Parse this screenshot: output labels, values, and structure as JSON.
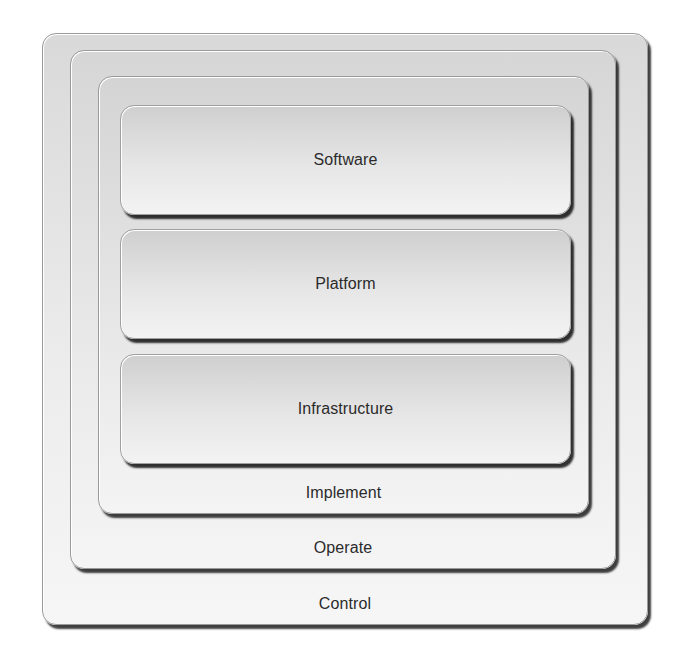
{
  "diagram": {
    "type": "nested-layers",
    "rings": [
      {
        "id": "control",
        "label": "Control"
      },
      {
        "id": "operate",
        "label": "Operate"
      },
      {
        "id": "implement",
        "label": "Implement"
      }
    ],
    "layers": [
      {
        "id": "software",
        "label": "Software"
      },
      {
        "id": "platform",
        "label": "Platform"
      },
      {
        "id": "infrastructure",
        "label": "Infrastructure"
      }
    ],
    "colors": {
      "text": "#2b2b2b",
      "box_fill_top": "#d2d2d2",
      "box_fill_bottom": "#f4f4f4",
      "shadow": "#222222"
    }
  }
}
